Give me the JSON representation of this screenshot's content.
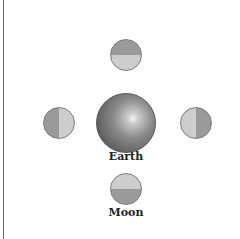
{
  "diagram": {
    "earth": {
      "label": "Earth",
      "center": [
        126,
        123
      ],
      "radius": 30
    },
    "moon_label": "Moon",
    "moons": [
      {
        "position": "top",
        "center": [
          126,
          55
        ],
        "dark_side": "top",
        "light_side": "bottom"
      },
      {
        "position": "left",
        "center": [
          59,
          123
        ],
        "dark_side": "left",
        "light_side": "right"
      },
      {
        "position": "right",
        "center": [
          196,
          123
        ],
        "dark_side": "right",
        "light_side": "left"
      },
      {
        "position": "bottom",
        "center": [
          126,
          189
        ],
        "dark_side": "bottom",
        "light_side": "top"
      }
    ],
    "colors": {
      "dark": "#9a9a9a",
      "light": "#cdcdcd",
      "background": "#ffffff"
    }
  }
}
